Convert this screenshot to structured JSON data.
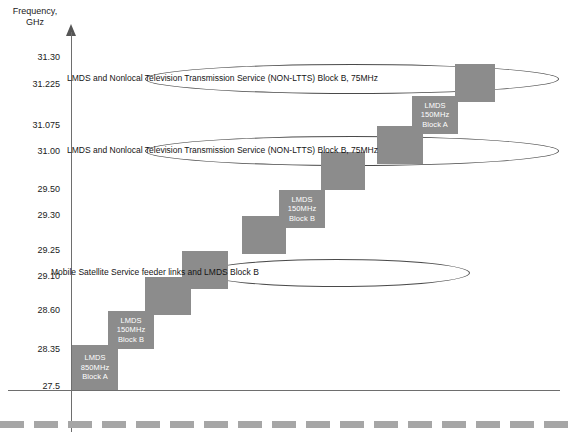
{
  "axis": {
    "y_title_line1": "Frequency,",
    "y_title_line2": "GHz",
    "ticks": [
      {
        "label": "31.30",
        "y": 58
      },
      {
        "label": "31.225",
        "y": 85
      },
      {
        "label": "31.075",
        "y": 126
      },
      {
        "label": "31.00",
        "y": 152
      },
      {
        "label": "29.50",
        "y": 190
      },
      {
        "label": "29.30",
        "y": 216
      },
      {
        "label": "29.25",
        "y": 251
      },
      {
        "label": "29.10",
        "y": 277
      },
      {
        "label": "28.60",
        "y": 311
      },
      {
        "label": "28.35",
        "y": 350
      },
      {
        "label": "27.5",
        "y": 387
      }
    ]
  },
  "blocks": [
    {
      "id": "lmds-a-850",
      "lines": [
        "LMDS",
        "850MHz",
        "Block A"
      ],
      "x": 72,
      "y": 345,
      "w": 46,
      "h": 45
    },
    {
      "id": "lmds-b-150-low",
      "lines": [
        "LMDS",
        "150MHz",
        "Block B"
      ],
      "x": 108,
      "y": 311,
      "w": 46,
      "h": 38
    },
    {
      "id": "step-blank-1",
      "lines": [],
      "x": 145,
      "y": 277,
      "w": 46,
      "h": 38
    },
    {
      "id": "step-blank-2",
      "lines": [],
      "x": 182,
      "y": 251,
      "w": 46,
      "h": 38
    },
    {
      "id": "step-blank-3",
      "lines": [],
      "x": 242,
      "y": 216,
      "w": 44,
      "h": 38
    },
    {
      "id": "lmds-b-150-mid",
      "lines": [
        "LMDS",
        "150MHz",
        "Block B"
      ],
      "x": 279,
      "y": 190,
      "w": 46,
      "h": 38
    },
    {
      "id": "step-blank-4",
      "lines": [],
      "x": 321,
      "y": 152,
      "w": 44,
      "h": 38
    },
    {
      "id": "step-blank-5",
      "lines": [],
      "x": 377,
      "y": 126,
      "w": 46,
      "h": 38
    },
    {
      "id": "lmds-a-150",
      "lines": [
        "LMDS",
        "150MHz",
        "Block A"
      ],
      "x": 412,
      "y": 96,
      "w": 46,
      "h": 38
    },
    {
      "id": "step-blank-6",
      "lines": [],
      "x": 455,
      "y": 64,
      "w": 40,
      "h": 38
    }
  ],
  "ellipses": [
    {
      "id": "non-ltts-top",
      "text": "LMDS and Nonlocal Television Transmission Service (NON-LTTS) Block B, 75MHz",
      "x": 145,
      "y": 64,
      "w": 412,
      "h": 28,
      "text_center_x": 351,
      "text_y": 73
    },
    {
      "id": "non-ltts-bottom",
      "text": "LMDS and Nonlocal Television Transmission Service (NON-LTTS) Block B, 75MHz",
      "x": 145,
      "y": 136,
      "w": 412,
      "h": 28,
      "text_center_x": 351,
      "text_y": 145
    },
    {
      "id": "mss-feeder",
      "text": "Mobile Satellite Service feeder links and LMDS Block B",
      "x": 203,
      "y": 259,
      "w": 265,
      "h": 26,
      "text_center_x": 335,
      "text_y": 267
    }
  ],
  "colors": {
    "block_fill": "#8c8c8c",
    "block_text": "#ffffff",
    "axis": "#6e6e6e",
    "ellipse_stroke": "#4a4a4a",
    "dashed_rule": "#a6a6a6",
    "text": "#1b1b1b"
  }
}
